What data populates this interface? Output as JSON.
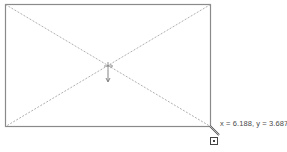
{
  "drawing": {
    "shape": "rectangle",
    "rect": {
      "x1": 5,
      "y1": 4,
      "x2": 210,
      "y2": 126
    },
    "stroke_color": "#8a8a8a",
    "diagonal_color": "#9a9a9a",
    "diagonals": "dashed"
  },
  "center_marker": {
    "icon": "move-crosshair-icon",
    "arrow": "arrow-down-icon"
  },
  "cursor": {
    "icon": "pencil-icon",
    "snap_box": "snap-square-icon"
  },
  "status": {
    "coordinates": "x = 6.188, y = 3.687"
  }
}
